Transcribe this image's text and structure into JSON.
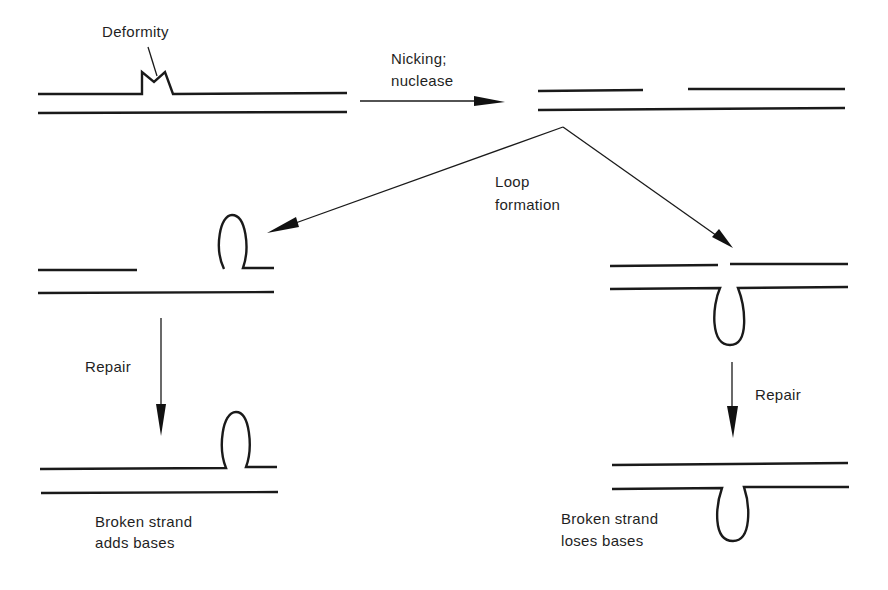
{
  "diagram": {
    "colors": {
      "ink": "#1a1a1a",
      "background": "#ffffff"
    },
    "labels": {
      "deformity": "Deformity",
      "nicking_line1": "Nicking;",
      "nicking_line2": "nuclease",
      "loop_line1": "Loop",
      "loop_line2": "formation",
      "repair_left": "Repair",
      "repair_right": "Repair",
      "left_result_line1": "Broken strand",
      "left_result_line2": "adds bases",
      "right_result_line1": "Broken strand",
      "right_result_line2": "loses bases"
    },
    "stages": [
      {
        "id": "deformed-duplex",
        "description": "Double strand with deformity bump on top strand"
      },
      {
        "id": "nicked-duplex",
        "description": "Top strand nicked, gap created"
      },
      {
        "id": "loop-top",
        "description": "Broken strand forms loop upward (left branch)"
      },
      {
        "id": "loop-bottom",
        "description": "Intact strand forms loop downward (right branch)"
      },
      {
        "id": "repaired-adds",
        "description": "Repaired: broken strand adds bases"
      },
      {
        "id": "repaired-loses",
        "description": "Repaired: broken strand loses bases"
      }
    ],
    "arrows": [
      {
        "from": "deformed-duplex",
        "to": "nicked-duplex",
        "label": "Nicking; nuclease"
      },
      {
        "from": "nicked-duplex",
        "to": "loop-top",
        "label": "Loop formation"
      },
      {
        "from": "nicked-duplex",
        "to": "loop-bottom",
        "label": "Loop formation"
      },
      {
        "from": "loop-top",
        "to": "repaired-adds",
        "label": "Repair"
      },
      {
        "from": "loop-bottom",
        "to": "repaired-loses",
        "label": "Repair"
      }
    ]
  }
}
